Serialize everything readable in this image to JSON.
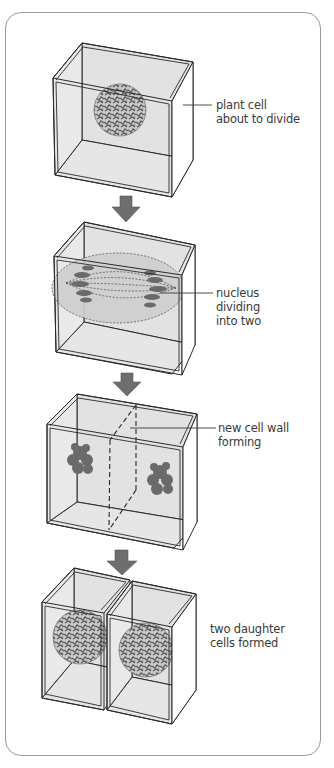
{
  "diagram": {
    "colors": {
      "frame": "#9a9a9a",
      "box_line": "#2a2a2a",
      "box_fill": "#e2e2e2",
      "arrow": "#6e6e6e",
      "chromatin": "#6a6a6a",
      "label_text": "#3a3a3a"
    },
    "stages": [
      {
        "id": "stage-1",
        "label": "plant cell\nabout to divide"
      },
      {
        "id": "stage-2",
        "label": "nucleus\ndividing\ninto two"
      },
      {
        "id": "stage-3",
        "label": "new cell wall\nforming"
      },
      {
        "id": "stage-4",
        "label": "two daughter\ncells formed"
      }
    ],
    "arrows": [
      {
        "from": "stage-1",
        "to": "stage-2",
        "icon": "down-arrow-icon"
      },
      {
        "from": "stage-2",
        "to": "stage-3",
        "icon": "down-arrow-icon"
      },
      {
        "from": "stage-3",
        "to": "stage-4",
        "icon": "down-arrow-icon"
      }
    ]
  }
}
